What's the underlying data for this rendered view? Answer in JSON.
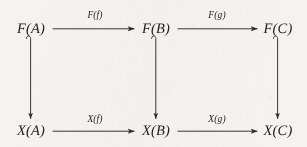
{
  "diagram": {
    "kind": "commutative-diagram",
    "background_color": "#f4f3f1",
    "ink_color": "#262626",
    "nodes": [
      {
        "id": "FA",
        "label": "F(A)",
        "x": 31,
        "y": 29
      },
      {
        "id": "FB",
        "label": "F(B)",
        "x": 156,
        "y": 29
      },
      {
        "id": "FC",
        "label": "F(C)",
        "x": 278,
        "y": 29
      },
      {
        "id": "XA",
        "label": "X(A)",
        "x": 31,
        "y": 131
      },
      {
        "id": "XB",
        "label": "X(B)",
        "x": 156,
        "y": 131
      },
      {
        "id": "XC",
        "label": "X(C)",
        "x": 278,
        "y": 131
      }
    ],
    "edges": [
      {
        "id": "top-left",
        "from": "FA",
        "to": "FB",
        "label": "F(f)",
        "label_x": 95,
        "label_y": 15,
        "orientation": "horizontal"
      },
      {
        "id": "top-right",
        "from": "FB",
        "to": "FC",
        "label": "F(g)",
        "label_x": 217,
        "label_y": 15,
        "orientation": "horizontal"
      },
      {
        "id": "bottom-left",
        "from": "XA",
        "to": "XB",
        "label": "X(f)",
        "label_x": 95,
        "label_y": 119,
        "orientation": "horizontal"
      },
      {
        "id": "bottom-right",
        "from": "XB",
        "to": "XC",
        "label": "X(g)",
        "label_x": 217,
        "label_y": 119,
        "orientation": "horizontal"
      },
      {
        "id": "left-down",
        "from": "FA",
        "to": "XA",
        "label": "",
        "orientation": "vertical"
      },
      {
        "id": "middle-down",
        "from": "FB",
        "to": "XB",
        "label": "",
        "orientation": "vertical"
      },
      {
        "id": "right-down",
        "from": "FC",
        "to": "XC",
        "label": "",
        "orientation": "vertical"
      }
    ]
  }
}
